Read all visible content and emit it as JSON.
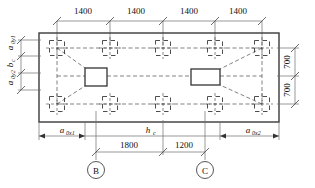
{
  "drawing": {
    "title": "Pile cap foundation plan",
    "top_dimensions": [
      "1400",
      "1400",
      "1400",
      "1400"
    ],
    "right_dimensions": [
      "700",
      "700"
    ],
    "bottom_dimensions": [
      "1800",
      "1200"
    ],
    "grid_labels": [
      "B",
      "C"
    ],
    "symbols": {
      "a0y1": "a",
      "a0y1_sub": "0y1",
      "bc": "b",
      "bc_sub": "c",
      "a0y2": "a",
      "a0y2_sub": "0y2",
      "a0x1": "a",
      "a0x1_sub": "0x1",
      "a0x2": "a",
      "a0x2_sub": "0x2",
      "hc": "h",
      "hc_sub": "c"
    },
    "colors": {
      "outline": "#3a3a3a",
      "dash": "#3a3a3a",
      "dimline": "#6e6e6e",
      "text": "#111111"
    },
    "geometry": {
      "cap_x": 39,
      "cap_y": 33,
      "cap_w": 240,
      "cap_h": 89,
      "pile_cols_x": [
        57,
        110,
        163,
        215,
        262
      ],
      "pile_rows_y": [
        48,
        104
      ],
      "pile_size": 15,
      "col1": {
        "x": 85,
        "y": 68,
        "w": 22,
        "h": 18
      },
      "col2": {
        "x": 191,
        "y": 69,
        "w": 29,
        "h": 16
      }
    }
  }
}
